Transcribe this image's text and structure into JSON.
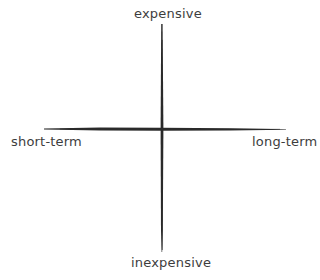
{
  "diagram": {
    "type": "quadrant-axes",
    "axes": {
      "vertical": {
        "top_label": "expensive",
        "bottom_label": "inexpensive"
      },
      "horizontal": {
        "left_label": "short-term",
        "right_label": "long-term"
      }
    },
    "colors": {
      "line": "#2b2b2b",
      "text": "#3d3d3d",
      "background": "#ffffff"
    }
  }
}
